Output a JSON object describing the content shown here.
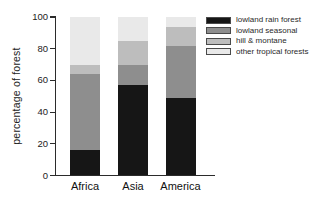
{
  "chart_data": {
    "type": "bar",
    "stacked": true,
    "title": "",
    "xlabel": "",
    "ylabel": "percentage of forest",
    "ylim": [
      0,
      100
    ],
    "yticks": [
      0,
      20,
      40,
      60,
      80,
      100
    ],
    "categories": [
      "Africa",
      "Asia",
      "America"
    ],
    "series": [
      {
        "name": "lowland rain forest",
        "color": "#161616",
        "values": [
          16,
          57,
          49
        ]
      },
      {
        "name": "lowland seasonal",
        "color": "#8e8e8e",
        "values": [
          48,
          13,
          33
        ]
      },
      {
        "name": "hill & montane",
        "color": "#bdbdbd",
        "values": [
          6,
          15,
          12
        ]
      },
      {
        "name": "other tropical forests",
        "color": "#e9e9e9",
        "values": [
          30,
          15,
          6
        ]
      }
    ],
    "grid": false,
    "legend_position": "top-right"
  }
}
